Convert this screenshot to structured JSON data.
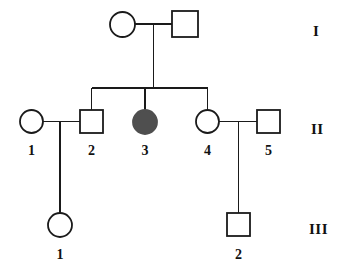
{
  "figure": {
    "kind": "pedigree-chart",
    "background_color": "#ffffff",
    "stroke_color": "#1a1a1a",
    "affected_fill_color": "#4f4f4f",
    "unaffected_fill_color": "#ffffff",
    "width": 350,
    "height": 276
  },
  "generation_labels": [
    {
      "text": "I",
      "x": 313,
      "y": 24
    },
    {
      "text": "II",
      "x": 311,
      "y": 122
    },
    {
      "text": "III",
      "x": 309,
      "y": 222
    }
  ],
  "individuals": [
    {
      "id": "I-1",
      "generation": "I",
      "number": "",
      "sex": "female",
      "shape": "circle",
      "affected": false,
      "cx": 122.5,
      "cy": 24.5,
      "r": 12.5
    },
    {
      "id": "I-2",
      "generation": "I",
      "number": "",
      "sex": "male",
      "shape": "square",
      "affected": false,
      "cx": 185,
      "cy": 24,
      "size": 26
    },
    {
      "id": "II-1",
      "generation": "II",
      "number": "1",
      "sex": "female",
      "shape": "circle",
      "affected": false,
      "cx": 31.5,
      "cy": 121.5,
      "r": 11.5,
      "label_x": 31.5,
      "label_y": 144
    },
    {
      "id": "II-2",
      "generation": "II",
      "number": "2",
      "sex": "male",
      "shape": "square",
      "affected": false,
      "cx": 91.5,
      "cy": 121.5,
      "size": 23,
      "label_x": 91.5,
      "label_y": 144
    },
    {
      "id": "II-3",
      "generation": "II",
      "number": "3",
      "sex": "female",
      "shape": "circle",
      "affected": true,
      "cx": 145,
      "cy": 122,
      "r": 12,
      "label_x": 145,
      "label_y": 144
    },
    {
      "id": "II-4",
      "generation": "II",
      "number": "4",
      "sex": "female",
      "shape": "circle",
      "affected": false,
      "cx": 207.5,
      "cy": 121.5,
      "r": 11.5,
      "label_x": 207.5,
      "label_y": 144
    },
    {
      "id": "II-5",
      "generation": "II",
      "number": "5",
      "sex": "male",
      "shape": "square",
      "affected": false,
      "cx": 268.5,
      "cy": 121.5,
      "size": 23,
      "label_x": 268.5,
      "label_y": 144
    },
    {
      "id": "III-1",
      "generation": "III",
      "number": "1",
      "sex": "female",
      "shape": "circle",
      "affected": false,
      "cx": 60,
      "cy": 225,
      "r": 12,
      "label_x": 60,
      "label_y": 248
    },
    {
      "id": "III-2",
      "generation": "III",
      "number": "2",
      "sex": "male",
      "shape": "square",
      "affected": false,
      "cx": 238.5,
      "cy": 224.5,
      "size": 23,
      "label_x": 238.5,
      "label_y": 248
    }
  ],
  "connections": [
    {
      "name": "mating-line-I1-I2",
      "type": "horizontal",
      "x1": 135,
      "x2": 172,
      "y": 24
    },
    {
      "name": "descent-line-gen1-to-sibship",
      "type": "vertical",
      "x": 153.5,
      "y1": 24,
      "y2": 88
    },
    {
      "name": "sibship-line-gen2",
      "type": "horizontal",
      "x1": 91.5,
      "x2": 207.5,
      "y": 88
    },
    {
      "name": "drop-line-II2",
      "type": "vertical",
      "x": 91.5,
      "y1": 88,
      "y2": 110
    },
    {
      "name": "drop-line-II3",
      "type": "vertical",
      "x": 145,
      "y1": 88,
      "y2": 110
    },
    {
      "name": "drop-line-II4",
      "type": "vertical",
      "x": 207.5,
      "y1": 88,
      "y2": 110
    },
    {
      "name": "mating-line-II1-II2",
      "type": "horizontal",
      "x1": 43,
      "x2": 80,
      "y": 121.5
    },
    {
      "name": "descent-line-II1xII2-to-III1",
      "type": "vertical",
      "x": 60,
      "y1": 121.5,
      "y2": 213
    },
    {
      "name": "mating-line-II4-II5",
      "type": "horizontal",
      "x1": 219,
      "x2": 257,
      "y": 121.5
    },
    {
      "name": "descent-line-II4xII5-to-III2",
      "type": "vertical",
      "x": 238.5,
      "y1": 121.5,
      "y2": 213
    }
  ]
}
